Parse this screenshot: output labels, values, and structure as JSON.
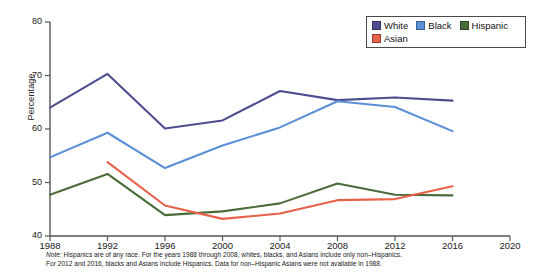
{
  "chart_data": {
    "type": "line",
    "title": "",
    "xlabel": "",
    "ylabel": "Percentage",
    "xlim": [
      1988,
      2020
    ],
    "ylim": [
      40,
      80
    ],
    "grid": false,
    "legend_position": "top-right",
    "x": [
      1988,
      1992,
      1996,
      2000,
      2004,
      2008,
      2012,
      2016
    ],
    "xticks": [
      "1988",
      "1992",
      "1996",
      "2000",
      "2004",
      "2008",
      "2012",
      "2016",
      "2020"
    ],
    "yticks": [
      "40",
      "50",
      "60",
      "70",
      "80"
    ],
    "series": [
      {
        "name": "White",
        "color": "#4d4d8f",
        "x": [
          1988,
          1992,
          1996,
          2000,
          2004,
          2008,
          2012,
          2016
        ],
        "values": [
          64.0,
          70.3,
          60.1,
          61.6,
          67.1,
          65.4,
          65.9,
          65.3
        ]
      },
      {
        "name": "Black",
        "color": "#5b8fd6",
        "x": [
          1988,
          1992,
          1996,
          2000,
          2004,
          2008,
          2012,
          2016
        ],
        "values": [
          54.7,
          59.3,
          52.7,
          56.9,
          60.3,
          65.2,
          64.1,
          59.6
        ]
      },
      {
        "name": "Hispanic",
        "color": "#4a6b3a",
        "x": [
          1988,
          1992,
          1996,
          2000,
          2004,
          2008,
          2012,
          2016
        ],
        "values": [
          47.7,
          51.6,
          43.9,
          44.6,
          46.1,
          49.8,
          47.7,
          47.6
        ]
      },
      {
        "name": "Asian",
        "color": "#e8604a",
        "x": [
          1992,
          1996,
          2000,
          2004,
          2008,
          2012,
          2016
        ],
        "values": [
          53.8,
          45.7,
          43.2,
          44.2,
          46.7,
          46.9,
          49.3
        ]
      }
    ]
  },
  "legend": {
    "items": [
      {
        "label": "White",
        "color": "#4d4d8f"
      },
      {
        "label": "Black",
        "color": "#5b8fd6"
      },
      {
        "label": "Hispanic",
        "color": "#4a6b3a"
      },
      {
        "label": "Asian",
        "color": "#e8604a"
      }
    ]
  },
  "axis": {
    "y_label": "Percentage",
    "y_ticks": [
      "80",
      "70",
      "60",
      "50",
      "40"
    ],
    "x_ticks": [
      "1988",
      "1992",
      "1996",
      "2000",
      "2004",
      "2008",
      "2012",
      "2016",
      "2020"
    ]
  },
  "note": {
    "prefix": "Note:",
    "line1": " Hispanics are of any race. For the years 1988 through 2008, whites, blacks, and Asians include only non–Hispanics.",
    "line2": "For 2012 and 2016, blacks and Asians include Hispanics. Data for non–Hispanic Asians were not available in 1988."
  }
}
